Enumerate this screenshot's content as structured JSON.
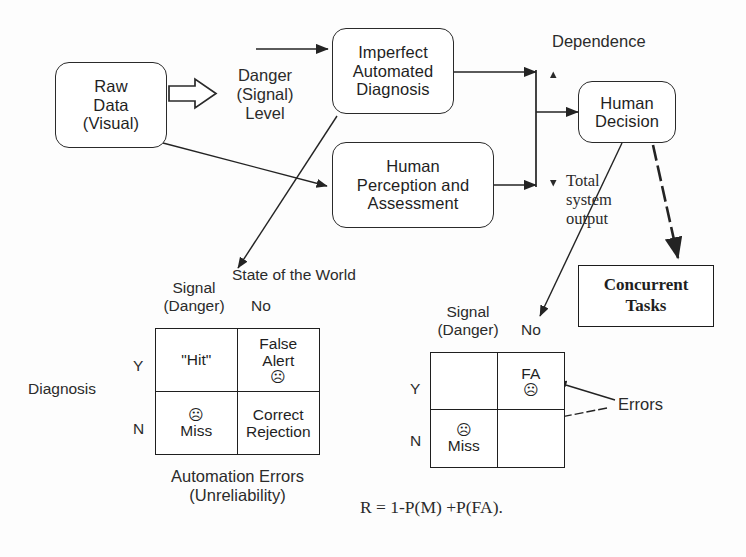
{
  "diagram": {
    "boxes": {
      "raw_data": "Raw\nData\n(Visual)",
      "raw_data_lines": [
        "Raw",
        "Data",
        "(Visual)"
      ],
      "imperfect": [
        "Imperfect",
        "Automated",
        "Diagnosis"
      ],
      "human_perception": [
        "Human",
        "Perception and",
        "Assessment"
      ],
      "human_decision": [
        "Human",
        "Decision"
      ],
      "concurrent": [
        "Concurrent",
        "Tasks"
      ]
    },
    "labels": {
      "danger_signal_level": [
        "Danger",
        "(Signal)",
        "Level"
      ],
      "dependence": "Dependence",
      "total_system_output": [
        "Total",
        "system",
        "output"
      ],
      "state_of_the_world": "State of the World",
      "errors": "Errors",
      "automation_errors": [
        "Automation Errors",
        "(Unreliability)"
      ],
      "formula": "R = 1-P(M) +P(FA)."
    },
    "left_matrix": {
      "col_header_1": [
        "Signal",
        "(Danger)"
      ],
      "col_header_2": "No",
      "row_axis_label": "Diagnosis",
      "row_header_1": "Y",
      "row_header_2": "N",
      "cells": [
        {
          "name": "hit",
          "lines": [
            "\"Hit\""
          ],
          "sad": false,
          "sad_position": "none"
        },
        {
          "name": "false-alert",
          "lines": [
            "False",
            "Alert"
          ],
          "sad": true,
          "sad_position": "below"
        },
        {
          "name": "miss",
          "lines": [
            "Miss"
          ],
          "sad": true,
          "sad_position": "above"
        },
        {
          "name": "correct-rejection",
          "lines": [
            "Correct",
            "Rejection"
          ],
          "sad": false,
          "sad_position": "none"
        }
      ]
    },
    "right_matrix": {
      "col_header_1": [
        "Signal",
        "(Danger)"
      ],
      "col_header_2": "No",
      "row_header_1": "Y",
      "row_header_2": "N",
      "cells": [
        {
          "name": "empty-hit",
          "lines": [],
          "sad": false,
          "sad_position": "none"
        },
        {
          "name": "fa",
          "lines": [
            "FA"
          ],
          "sad": true,
          "sad_position": "below"
        },
        {
          "name": "miss",
          "lines": [
            "Miss"
          ],
          "sad": true,
          "sad_position": "above"
        },
        {
          "name": "empty-cr",
          "lines": [],
          "sad": false,
          "sad_position": "none"
        }
      ]
    },
    "glyphs": {
      "sad_face": "☹",
      "arrow_up": "▲",
      "arrow_down": "▼"
    },
    "colors": {
      "ink": "#1f1f1f",
      "line": "#2a2a2a",
      "background": "#ffffff"
    }
  }
}
